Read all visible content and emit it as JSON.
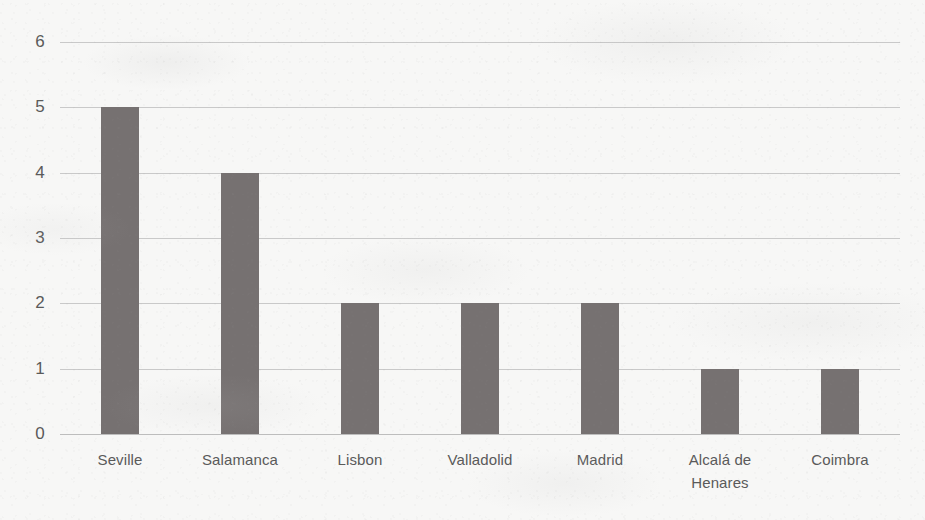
{
  "chart_data": {
    "type": "bar",
    "title": "",
    "subtitle": "",
    "xlabel": "",
    "ylabel": "",
    "categories": [
      "Seville",
      "Salamanca",
      "Lisbon",
      "Valladolid",
      "Madrid",
      "Alcalá de Henares",
      "Coimbra"
    ],
    "values": [
      5,
      4,
      2,
      2,
      2,
      1,
      1
    ],
    "ylim": [
      0,
      6
    ],
    "ytick_labels": [
      "0",
      "1",
      "2",
      "3",
      "4",
      "5",
      "6"
    ],
    "ytick_values": [
      0,
      1,
      2,
      3,
      4,
      5,
      6
    ],
    "grid": true,
    "grid_axis": "y",
    "legend": false,
    "legend_position": "none",
    "bar_color": "#767171",
    "gridline_color": "#c9c9c9",
    "axis_text_color": "#5a5a5a",
    "background_color": "#f7f7f6",
    "annotations": [],
    "series": [
      {
        "name": "",
        "values": [
          5,
          4,
          2,
          2,
          2,
          1,
          1
        ]
      }
    ]
  }
}
